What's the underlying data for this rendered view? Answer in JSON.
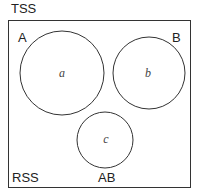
{
  "title": "TSS",
  "regions": {
    "A": "A",
    "B": "B",
    "RSS": "RSS",
    "AB": "AB"
  },
  "circles": [
    {
      "label": "a",
      "cx": 62,
      "cy": 73,
      "r": 42
    },
    {
      "label": "b",
      "cx": 149,
      "cy": 73,
      "r": 36
    },
    {
      "label": "c",
      "cx": 105,
      "cy": 140,
      "r": 28
    }
  ],
  "colors": {
    "stroke": "#333333",
    "background": "#ffffff"
  }
}
